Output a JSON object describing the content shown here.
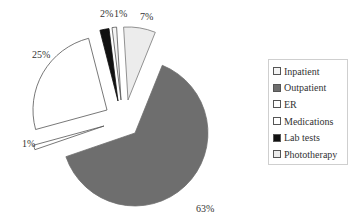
{
  "chart_data": {
    "type": "pie",
    "title": "",
    "exploded": true,
    "start_angle_deg": 22,
    "direction": "clockwise",
    "slices": [
      {
        "label": "Outpatient",
        "value": 63,
        "display": "63%",
        "color": "#6e6e6e",
        "stroke": "#6e6e6e"
      },
      {
        "label": "ER",
        "value": 1,
        "display": "1%",
        "color": "#ffffff",
        "stroke": "#555555"
      },
      {
        "label": "Medications",
        "value": 25,
        "display": "25%",
        "color": "#ffffff",
        "stroke": "#555555"
      },
      {
        "label": "Lab tests",
        "value": 2,
        "display": "2%",
        "color": "#111111",
        "stroke": "#111111"
      },
      {
        "label": "Inpatient",
        "value": 1,
        "display": "1%",
        "color": "#f4f4f4",
        "stroke": "#555555"
      },
      {
        "label": "Phototherapy",
        "value": 7,
        "display": "7%",
        "color": "#ececec",
        "stroke": "#777777"
      }
    ],
    "legend": {
      "position": "right",
      "entries": [
        "Inpatient",
        "Outpatient",
        "ER",
        "Medications",
        "Lab tests",
        "Phototherapy"
      ]
    }
  },
  "legend": {
    "items": [
      {
        "label": "Inpatient",
        "color": "#f4f4f4"
      },
      {
        "label": "Outpatient",
        "color": "#6e6e6e"
      },
      {
        "label": "ER",
        "color": "#ffffff"
      },
      {
        "label": "Medications",
        "color": "#ffffff"
      },
      {
        "label": "Lab tests",
        "color": "#111111"
      },
      {
        "label": "Phototherapy",
        "color": "#ececec"
      }
    ]
  }
}
